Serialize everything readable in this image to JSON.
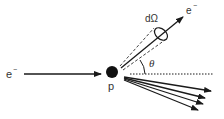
{
  "diagram": {
    "type": "electron-proton scattering",
    "labels": {
      "incoming_electron": "e",
      "incoming_electron_charge": "−",
      "scattered_electron": "e",
      "scattered_electron_charge": "−",
      "proton": "p",
      "solid_angle": "dΩ",
      "scattering_angle": "θ"
    },
    "elements": {
      "incoming_arrow": {
        "from": [
          24,
          74
        ],
        "to": [
          101,
          74
        ]
      },
      "proton": {
        "center": [
          112,
          72
        ],
        "radius": 6
      },
      "scattered_arrow": {
        "from": [
          121,
          68
        ],
        "to": [
          183,
          17
        ]
      },
      "reference_line": {
        "from": [
          130,
          74
        ],
        "to": [
          214,
          74
        ],
        "style": "dotted"
      },
      "fan_arrows": [
        {
          "from": [
            124,
            77
          ],
          "to": [
            211,
            91
          ]
        },
        {
          "from": [
            124,
            78
          ],
          "to": [
            205,
            98
          ]
        },
        {
          "from": [
            124,
            79
          ],
          "to": [
            203,
            104
          ]
        },
        {
          "from": [
            124,
            80
          ],
          "to": [
            198,
            110
          ]
        }
      ]
    },
    "colors": {
      "ink": "#1a1a1a",
      "label": "#333333",
      "background": "#ffffff"
    }
  }
}
